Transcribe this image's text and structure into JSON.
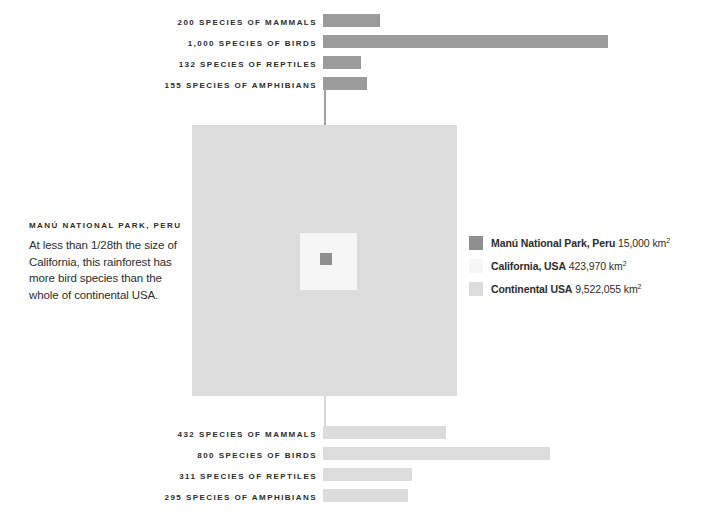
{
  "chart_data": {
    "type": "bar",
    "xlabel": "",
    "ylabel": "",
    "grid": false,
    "legend_position": "right",
    "series": [
      {
        "name": "Manú National Park, Peru",
        "color": "#9b9b9b",
        "categories": [
          "Mammals",
          "Birds",
          "Reptiles",
          "Amphibians"
        ],
        "values": [
          200,
          1000,
          132,
          155
        ]
      },
      {
        "name": "Continental USA",
        "color": "#dcdcdc",
        "categories": [
          "Mammals",
          "Birds",
          "Reptiles",
          "Amphibians"
        ],
        "values": [
          432,
          800,
          311,
          295
        ]
      }
    ],
    "areas": [
      {
        "name": "Manú National Park, Peru",
        "value_km2": 15000
      },
      {
        "name": "California, USA",
        "value_km2": 423970
      },
      {
        "name": "Continental USA",
        "value_km2": 9522055
      }
    ]
  },
  "top_bars": {
    "bar_color": "#9b9b9b",
    "max_value": 1000,
    "rows": [
      {
        "label": "200 SPECIES OF MAMMALS",
        "value": 200,
        "width_px": 57
      },
      {
        "label": "1,000 SPECIES OF BIRDS",
        "value": 1000,
        "width_px": 285
      },
      {
        "label": "132 SPECIES OF REPTILES",
        "value": 132,
        "width_px": 38
      },
      {
        "label": "155 SPECIES OF AMPHIBIANS",
        "value": 155,
        "width_px": 44
      }
    ]
  },
  "bottom_bars": {
    "bar_color": "#dcdcdc",
    "max_value": 800,
    "rows": [
      {
        "label": "432 SPECIES OF MAMMALS",
        "value": 432,
        "width_px": 123
      },
      {
        "label": "800 SPECIES OF BIRDS",
        "value": 800,
        "width_px": 227
      },
      {
        "label": "311 SPECIES OF REPTILES",
        "value": 311,
        "width_px": 89
      },
      {
        "label": "295 SPECIES OF AMPHIBIANS",
        "value": 295,
        "width_px": 85
      }
    ]
  },
  "description": {
    "heading": "MANÚ NATIONAL PARK, PERU",
    "body": "At less than 1/28th the size of California, this rainforest has more bird species than the whole of continental USA."
  },
  "legend": {
    "rows": [
      {
        "name": "Manú National Park, Peru",
        "area": "15,000 km",
        "unit_exponent": "2",
        "color": "#8f8f8f"
      },
      {
        "name": "California, USA",
        "area": "423,970 km",
        "unit_exponent": "2",
        "color": "#f6f6f6"
      },
      {
        "name": "Continental USA",
        "area": "9,522,055 km",
        "unit_exponent": "2",
        "color": "#dcdcdc"
      }
    ]
  },
  "squares": {
    "continental_usa_color": "#dcdcdc",
    "california_color": "#f6f6f6",
    "manu_color": "#8f8f8f"
  }
}
